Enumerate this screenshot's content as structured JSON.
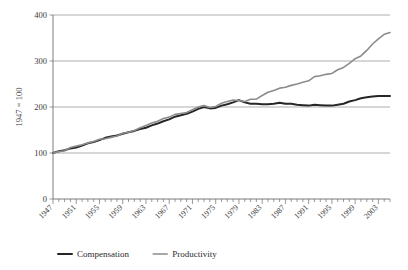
{
  "chart_data": {
    "type": "line",
    "title": "",
    "subtitle": "",
    "xlabel": "",
    "ylabel": "1947 = 100",
    "ylim": [
      0,
      400
    ],
    "xlim": [
      1947,
      2005
    ],
    "yticks": [
      0,
      100,
      200,
      300,
      400
    ],
    "ytick_labels": [
      "0",
      "100",
      "200",
      "300",
      "400"
    ],
    "grid": true,
    "legend_position": "bottom-left",
    "x_tick_interval": 4,
    "x_minor_tick_interval": 1,
    "categories": [
      1947,
      1948,
      1949,
      1950,
      1951,
      1952,
      1953,
      1954,
      1955,
      1956,
      1957,
      1958,
      1959,
      1960,
      1961,
      1962,
      1963,
      1964,
      1965,
      1966,
      1967,
      1968,
      1969,
      1970,
      1971,
      1972,
      1973,
      1974,
      1975,
      1976,
      1977,
      1978,
      1979,
      1980,
      1981,
      1982,
      1983,
      1984,
      1985,
      1986,
      1987,
      1988,
      1989,
      1990,
      1991,
      1992,
      1993,
      1994,
      1995,
      1996,
      1997,
      1998,
      1999,
      2000,
      2001,
      2002,
      2003,
      2004,
      2005
    ],
    "xtick_labels": [
      "1947",
      "1951",
      "1955",
      "1959",
      "1963",
      "1967",
      "1971",
      "1975",
      "1979",
      "1983",
      "1987",
      "1991",
      "1995",
      "1999",
      "2003"
    ],
    "series": [
      {
        "name": "Compensation",
        "color": "#262626",
        "width": 2.0,
        "values": [
          100,
          104,
          106,
          110,
          112,
          116,
          121,
          124,
          128,
          133,
          136,
          138,
          142,
          145,
          148,
          152,
          155,
          160,
          164,
          169,
          173,
          179,
          182,
          185,
          190,
          196,
          200,
          197,
          198,
          203,
          206,
          210,
          215,
          210,
          207,
          207,
          206,
          206,
          207,
          209,
          207,
          207,
          205,
          204,
          203,
          205,
          204,
          203,
          203,
          205,
          207,
          212,
          215,
          219,
          221,
          223,
          224,
          224,
          224
        ]
      },
      {
        "name": "Productivity",
        "color": "#8c8c8c",
        "width": 1.6,
        "values": [
          100,
          103,
          105,
          112,
          115,
          118,
          122,
          125,
          130,
          131,
          134,
          137,
          143,
          145,
          149,
          155,
          160,
          165,
          169,
          175,
          178,
          184,
          186,
          188,
          194,
          200,
          203,
          199,
          201,
          208,
          212,
          215,
          214,
          212,
          217,
          217,
          225,
          232,
          236,
          241,
          243,
          247,
          250,
          254,
          257,
          266,
          268,
          271,
          273,
          281,
          286,
          295,
          305,
          311,
          323,
          337,
          348,
          358,
          362
        ]
      }
    ]
  },
  "legend": {
    "items": [
      {
        "label": "Compensation",
        "color": "#262626"
      },
      {
        "label": "Productivity",
        "color": "#8c8c8c"
      }
    ]
  }
}
